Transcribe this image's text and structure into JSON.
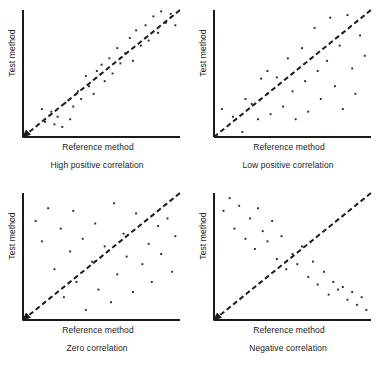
{
  "figure": {
    "axis_color": "#1a1a1a",
    "point_color": "#262626",
    "line_color": "#1a1a1a",
    "background": "#ffffff",
    "common_labels": {
      "y_axis": "Test method",
      "x_axis": "Reference method"
    }
  },
  "chart_data": [
    {
      "type": "scatter",
      "title": "High positive correlation",
      "xlabel": "Reference method",
      "ylabel": "Test method",
      "xlim": [
        0,
        100
      ],
      "ylim": [
        0,
        100
      ],
      "grid": false,
      "legend": null,
      "reference_line": {
        "style": "dashed",
        "from": [
          0,
          0
        ],
        "to": [
          100,
          100
        ],
        "label": "identity line"
      },
      "points": [
        [
          12,
          22
        ],
        [
          14,
          12
        ],
        [
          18,
          20
        ],
        [
          20,
          10
        ],
        [
          22,
          16
        ],
        [
          25,
          8
        ],
        [
          27,
          27
        ],
        [
          30,
          14
        ],
        [
          32,
          24
        ],
        [
          35,
          36
        ],
        [
          37,
          30
        ],
        [
          40,
          48
        ],
        [
          42,
          40
        ],
        [
          45,
          34
        ],
        [
          47,
          52
        ],
        [
          50,
          57
        ],
        [
          52,
          44
        ],
        [
          55,
          62
        ],
        [
          57,
          50
        ],
        [
          60,
          70
        ],
        [
          62,
          58
        ],
        [
          65,
          66
        ],
        [
          68,
          78
        ],
        [
          70,
          60
        ],
        [
          72,
          84
        ],
        [
          75,
          72
        ],
        [
          78,
          88
        ],
        [
          80,
          76
        ],
        [
          83,
          95
        ],
        [
          86,
          82
        ],
        [
          88,
          99
        ],
        [
          91,
          90
        ],
        [
          94,
          97
        ],
        [
          97,
          88
        ]
      ]
    },
    {
      "type": "scatter",
      "title": "Low positive correlation",
      "xlabel": "Reference method",
      "ylabel": "Test method",
      "xlim": [
        0,
        100
      ],
      "ylim": [
        0,
        100
      ],
      "grid": false,
      "legend": null,
      "reference_line": {
        "style": "dashed",
        "from": [
          0,
          0
        ],
        "to": [
          100,
          100
        ],
        "label": "identity line"
      },
      "points": [
        [
          5,
          22
        ],
        [
          12,
          16
        ],
        [
          18,
          4
        ],
        [
          20,
          30
        ],
        [
          24,
          26
        ],
        [
          28,
          14
        ],
        [
          30,
          46
        ],
        [
          34,
          52
        ],
        [
          36,
          18
        ],
        [
          40,
          47
        ],
        [
          44,
          24
        ],
        [
          47,
          62
        ],
        [
          50,
          36
        ],
        [
          52,
          14
        ],
        [
          56,
          70
        ],
        [
          58,
          44
        ],
        [
          60,
          20
        ],
        [
          64,
          86
        ],
        [
          66,
          52
        ],
        [
          68,
          30
        ],
        [
          72,
          60
        ],
        [
          74,
          94
        ],
        [
          77,
          40
        ],
        [
          80,
          72
        ],
        [
          82,
          22
        ],
        [
          85,
          96
        ],
        [
          88,
          54
        ],
        [
          90,
          34
        ],
        [
          93,
          80
        ],
        [
          96,
          64
        ]
      ]
    },
    {
      "type": "scatter",
      "title": "Zero correlation",
      "xlabel": "Reference method",
      "ylabel": "Test method",
      "xlim": [
        0,
        100
      ],
      "ylim": [
        0,
        100
      ],
      "grid": false,
      "legend": null,
      "reference_line": {
        "style": "dashed",
        "from": [
          0,
          0
        ],
        "to": [
          100,
          100
        ],
        "label": "identity line"
      },
      "points": [
        [
          8,
          78
        ],
        [
          12,
          62
        ],
        [
          16,
          88
        ],
        [
          20,
          40
        ],
        [
          24,
          72
        ],
        [
          26,
          18
        ],
        [
          30,
          54
        ],
        [
          32,
          86
        ],
        [
          34,
          30
        ],
        [
          38,
          64
        ],
        [
          40,
          8
        ],
        [
          44,
          46
        ],
        [
          46,
          76
        ],
        [
          48,
          24
        ],
        [
          52,
          58
        ],
        [
          56,
          14
        ],
        [
          58,
          92
        ],
        [
          60,
          36
        ],
        [
          64,
          68
        ],
        [
          66,
          50
        ],
        [
          70,
          22
        ],
        [
          72,
          84
        ],
        [
          76,
          44
        ],
        [
          80,
          60
        ],
        [
          82,
          30
        ],
        [
          86,
          74
        ],
        [
          88,
          52
        ],
        [
          92,
          80
        ],
        [
          95,
          38
        ],
        [
          97,
          66
        ]
      ]
    },
    {
      "type": "scatter",
      "title": "Negative correlation",
      "xlabel": "Reference method",
      "ylabel": "Test method",
      "xlim": [
        0,
        100
      ],
      "ylim": [
        0,
        100
      ],
      "grid": false,
      "legend": null,
      "reference_line": {
        "style": "dashed",
        "from": [
          0,
          0
        ],
        "to": [
          100,
          100
        ],
        "label": "identity line"
      },
      "points": [
        [
          6,
          86
        ],
        [
          10,
          96
        ],
        [
          13,
          72
        ],
        [
          16,
          90
        ],
        [
          20,
          64
        ],
        [
          23,
          80
        ],
        [
          26,
          56
        ],
        [
          28,
          88
        ],
        [
          31,
          70
        ],
        [
          34,
          62
        ],
        [
          37,
          78
        ],
        [
          40,
          48
        ],
        [
          43,
          66
        ],
        [
          46,
          40
        ],
        [
          50,
          52
        ],
        [
          53,
          44
        ],
        [
          56,
          58
        ],
        [
          60,
          34
        ],
        [
          63,
          46
        ],
        [
          66,
          28
        ],
        [
          70,
          38
        ],
        [
          73,
          20
        ],
        [
          76,
          30
        ],
        [
          79,
          24
        ],
        [
          82,
          26
        ],
        [
          85,
          16
        ],
        [
          88,
          22
        ],
        [
          91,
          12
        ],
        [
          94,
          18
        ],
        [
          97,
          8
        ]
      ]
    }
  ],
  "panels": [
    {
      "id": "panel-high-positive",
      "caption": "High positive correlation",
      "y_axis_label": "Test method",
      "x_axis_label": "Reference method",
      "origin_arrow": true
    },
    {
      "id": "panel-low-positive",
      "caption": "Low positive correlation",
      "y_axis_label": "Test method",
      "x_axis_label": "Reference method",
      "origin_arrow": false
    },
    {
      "id": "panel-zero",
      "caption": "Zero correlation",
      "y_axis_label": "Test method",
      "x_axis_label": "Reference method",
      "origin_arrow": true
    },
    {
      "id": "panel-negative",
      "caption": "Negative correlation",
      "y_axis_label": "Test method",
      "x_axis_label": "Reference method",
      "origin_arrow": true
    }
  ]
}
